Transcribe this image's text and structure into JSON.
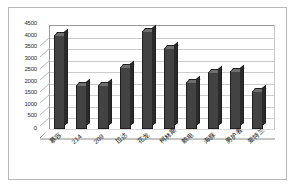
{
  "chart_data": {
    "type": "bar",
    "title": "",
    "subtitle": "",
    "xlabel": "",
    "ylabel": "",
    "categories": [
      "慕容",
      "214",
      "209",
      "拉达",
      "花龙",
      "柯林斯",
      "触电",
      "海豚",
      "男护者",
      "爱特兰"
    ],
    "values": [
      4050,
      1900,
      1900,
      2700,
      4250,
      3500,
      2050,
      2450,
      2500,
      1650
    ],
    "series": [
      {
        "name": "",
        "values": [
          4050,
          1900,
          1900,
          2700,
          4250,
          3500,
          2050,
          2450,
          2500,
          1650
        ]
      }
    ],
    "ylim": [
      0,
      4500
    ],
    "ytick_step": 500,
    "yticks": [
      0,
      500,
      1000,
      1500,
      2000,
      2500,
      3000,
      3500,
      4000,
      4500
    ],
    "ytick_labels": [
      "0",
      "500",
      "1000",
      "1500",
      "2000",
      "2500",
      "3000",
      "3500",
      "4000",
      "4500"
    ],
    "grid": true,
    "grid_axis": "y",
    "legend": false,
    "legend_position": "none",
    "style": "3d-column",
    "bar_color": "#434343",
    "bar_top_color": "#6e6e6e",
    "bar_side_color": "#2a2a2a",
    "gridline_color": "#cccccc",
    "axis_color": "#8a8a8a",
    "border_color": "#b8b8b8",
    "background_color": "#ffffff",
    "text_color": "#222222"
  }
}
